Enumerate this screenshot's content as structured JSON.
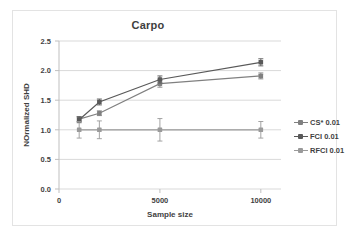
{
  "chart_data": {
    "type": "line",
    "title": "Carpo",
    "xlabel": "Sample size",
    "ylabel": "NOrmalized SHD",
    "xlim": [
      0,
      11000
    ],
    "ylim": [
      0.0,
      2.5
    ],
    "xticks": [
      0,
      5000,
      10000
    ],
    "xtick_labels": [
      "0",
      "5000",
      "10000"
    ],
    "yticks": [
      0.0,
      0.5,
      1.0,
      1.5,
      2.0,
      2.5
    ],
    "ytick_labels": [
      "0.0",
      "0.5",
      "1.0",
      "1.5",
      "2.0",
      "2.5"
    ],
    "grid": "horizontal",
    "legend_position": "right",
    "x": [
      1000,
      2000,
      5000,
      10000
    ],
    "series": [
      {
        "name": "CS* 0.01",
        "color": "#808080",
        "values": [
          1.18,
          1.28,
          1.78,
          1.91
        ],
        "errors": [
          0.04,
          0.04,
          0.06,
          0.05
        ]
      },
      {
        "name": "FCI 0.01",
        "color": "#595959",
        "values": [
          1.17,
          1.47,
          1.85,
          2.14
        ],
        "errors": [
          0.05,
          0.05,
          0.06,
          0.06
        ]
      },
      {
        "name": "RFCI 0.01",
        "color": "#9a9a9a",
        "values": [
          1.0,
          1.0,
          1.0,
          1.0
        ],
        "errors": [
          0.14,
          0.15,
          0.19,
          0.14
        ]
      }
    ]
  },
  "legend": {
    "items": [
      {
        "label": "CS* 0.01"
      },
      {
        "label": "FCI 0.01"
      },
      {
        "label": "RFCI 0.01"
      }
    ]
  },
  "colors": {
    "grid": "#d9d9d9",
    "axis": "#bfbfbf",
    "text": "#3f3f3f",
    "border": "#e3e3e3"
  }
}
